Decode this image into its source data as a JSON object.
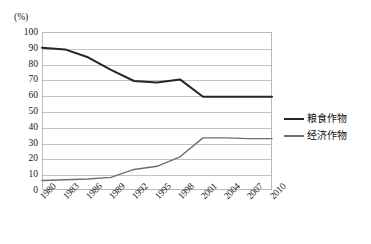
{
  "chart_data": {
    "type": "line",
    "title": "",
    "subtitle": "",
    "unit_label": "(%)",
    "xlabel": "",
    "ylabel": "",
    "ylim": [
      0,
      100
    ],
    "ytick_step": 10,
    "grid": true,
    "legend_position": "right",
    "categories": [
      "1980",
      "1983",
      "1986",
      "1989",
      "1992",
      "1995",
      "1998",
      "2001",
      "2004",
      "2007",
      "2010"
    ],
    "yticks": [
      "100",
      "90",
      "80",
      "70",
      "60",
      "50",
      "40",
      "30",
      "20",
      "10",
      "0"
    ],
    "series": [
      {
        "name": "粮食作物",
        "color": "#262626",
        "values": [
          90,
          89,
          84,
          76,
          69,
          68,
          70,
          59,
          59,
          59,
          59
        ]
      },
      {
        "name": "经济作物",
        "color": "#6e6e6e",
        "values": [
          6,
          6.5,
          7,
          8,
          13,
          15,
          21,
          33,
          33,
          32.5,
          32.5
        ]
      }
    ]
  },
  "legend": {
    "items": [
      {
        "label": "粮食作物",
        "color": "#262626"
      },
      {
        "label": "经济作物",
        "color": "#6e6e6e"
      }
    ]
  },
  "colors": {
    "grain_crops": "#262626",
    "cash_crops": "#6e6e6e",
    "gridline": "#c3c3c3",
    "frame": "#b9b9b9",
    "text": "#1a1a1a",
    "background": "#ffffff"
  }
}
